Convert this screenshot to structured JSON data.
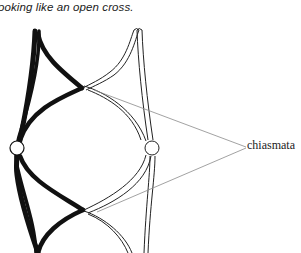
{
  "caption": "ooking like an open cross.",
  "diagram": {
    "label": "chiasmata",
    "elements": {
      "chromosome_1": "black (dark) homologous chromosome, two sister chromatids",
      "chromosome_2": "white (outlined) homologous chromosome, two sister chromatids",
      "centromeres": 2,
      "chiasmata_count": 2
    },
    "colors": {
      "dark_chromatid": "#111111",
      "outline": "#222222",
      "pointer_line": "#8a8a8a",
      "background": "#ffffff"
    }
  }
}
